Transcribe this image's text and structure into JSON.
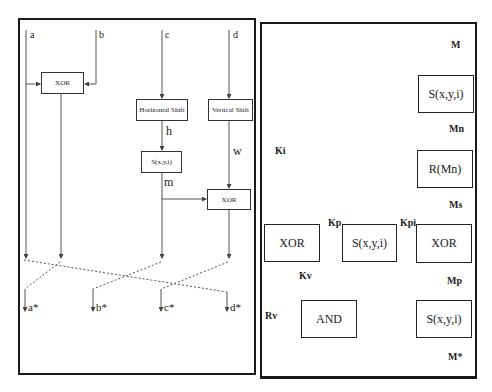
{
  "left_diagram": {
    "inputs": [
      "a",
      "b",
      "c",
      "d"
    ],
    "outputs": [
      "a*",
      "b*",
      "c*",
      "d*"
    ],
    "boxes": {
      "xor_top": "XOR",
      "horizontal_shift": "Horizontal Shift",
      "vertical_shift": "Vertical Shift",
      "s_box": "S(x,y,i)",
      "xor_bottom": "XOR"
    },
    "edge_labels": {
      "h": "h",
      "w": "w",
      "m": "m"
    }
  },
  "right_diagram": {
    "boxes": {
      "s_top": "S(x,y,i)",
      "r_mn": "R(Mn)",
      "xor_right": "XOR",
      "s_bottom": "S(x,y,i)",
      "xor_left": "XOR",
      "s_middle": "S(x,y,i)",
      "and": "AND"
    },
    "edge_labels": {
      "M": "M",
      "Mn": "Mn",
      "Ki": "Ki",
      "Ms": "Ms",
      "Kp": "Kp",
      "Kpi": "Kpi",
      "Kv": "Kv",
      "Mp": "Mp",
      "Rv": "Rv",
      "Mstar": "M*"
    }
  },
  "colors": {
    "line": "#444444",
    "border": "#1a1a1a",
    "background": "#ffffff"
  }
}
